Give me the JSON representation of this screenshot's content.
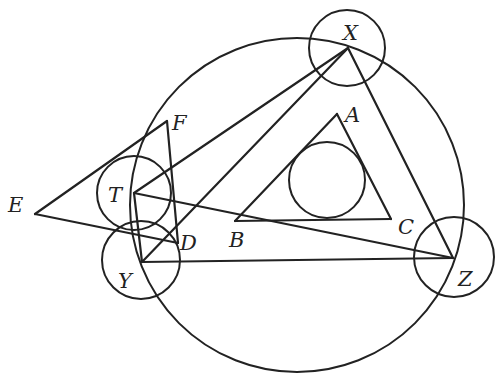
{
  "diagram": {
    "stroke_color": "#222222",
    "points": {
      "A": {
        "x": 337,
        "y": 114
      },
      "B": {
        "x": 235,
        "y": 221
      },
      "C": {
        "x": 391,
        "y": 219
      },
      "X": {
        "x": 348,
        "y": 48
      },
      "Y": {
        "x": 142,
        "y": 262
      },
      "Z": {
        "x": 453,
        "y": 258
      },
      "T": {
        "x": 134,
        "y": 193
      },
      "D": {
        "x": 178,
        "y": 243
      },
      "E": {
        "x": 35,
        "y": 214
      },
      "F": {
        "x": 167,
        "y": 121
      }
    },
    "labels": [
      {
        "text": "X",
        "x": 343,
        "y": 40
      },
      {
        "text": "A",
        "x": 345,
        "y": 122
      },
      {
        "text": "F",
        "x": 172,
        "y": 130
      },
      {
        "text": "T",
        "x": 108,
        "y": 202
      },
      {
        "text": "E",
        "x": 8,
        "y": 212
      },
      {
        "text": "B",
        "x": 229,
        "y": 247
      },
      {
        "text": "C",
        "x": 398,
        "y": 234
      },
      {
        "text": "D",
        "x": 180,
        "y": 250
      },
      {
        "text": "Y",
        "x": 118,
        "y": 288
      },
      {
        "text": "Z",
        "x": 458,
        "y": 286
      }
    ],
    "circles": [
      {
        "name": "circumcircle",
        "cx": 297,
        "cy": 205,
        "r": 167
      },
      {
        "name": "incircle-abc",
        "cx": 327,
        "cy": 180,
        "r": 38
      },
      {
        "name": "circle-x",
        "cx": 347,
        "cy": 48,
        "r": 38
      },
      {
        "name": "circle-z",
        "cx": 454,
        "cy": 257,
        "r": 40
      },
      {
        "name": "circle-y",
        "cx": 141,
        "cy": 260,
        "r": 39
      },
      {
        "name": "circle-t",
        "cx": 134,
        "cy": 193,
        "r": 37
      }
    ],
    "segments": [
      [
        "A",
        "B"
      ],
      [
        "B",
        "C"
      ],
      [
        "C",
        "A"
      ],
      [
        "X",
        "Y"
      ],
      [
        "Y",
        "Z"
      ],
      [
        "Z",
        "X"
      ],
      [
        "X",
        "T"
      ],
      [
        "T",
        "Z"
      ],
      [
        "E",
        "F"
      ],
      [
        "F",
        "D"
      ],
      [
        "D",
        "E"
      ],
      [
        "T",
        "Y"
      ]
    ]
  }
}
